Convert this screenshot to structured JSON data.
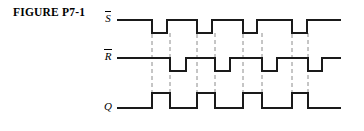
{
  "figure": {
    "caption": "FIGURE P7-1",
    "type": "digital-timing-diagram"
  },
  "signals": [
    {
      "id": "sbar",
      "label": "S",
      "overbar": true,
      "name": "S-bar",
      "active_low": true
    },
    {
      "id": "rbar",
      "label": "R",
      "overbar": true,
      "name": "R-bar",
      "active_low": true
    },
    {
      "id": "q",
      "label": "Q",
      "overbar": false,
      "name": "Q",
      "active_low": false
    }
  ],
  "chart_data": {
    "type": "line",
    "title": "FIGURE P7-1",
    "xlabel": "",
    "ylabel": "",
    "grid": false,
    "legend": "none",
    "x_range": [
      118,
      340
    ],
    "rows": [
      {
        "name": "S-bar",
        "label": "S",
        "overbar": true,
        "y_high": 20,
        "y_low": 33,
        "initial_level": "high",
        "transitions": [
          152,
          167,
          197,
          212,
          243,
          257,
          292,
          307
        ],
        "pulses": [
          {
            "start": 152,
            "end": 167,
            "polarity": "low"
          },
          {
            "start": 197,
            "end": 212,
            "polarity": "low"
          },
          {
            "start": 243,
            "end": 257,
            "polarity": "low"
          },
          {
            "start": 292,
            "end": 307,
            "polarity": "low"
          }
        ]
      },
      {
        "name": "R-bar",
        "label": "R",
        "overbar": true,
        "y_high": 58,
        "y_low": 71,
        "initial_level": "high",
        "transitions": [
          170,
          186,
          215,
          230,
          262,
          277,
          308,
          322
        ],
        "pulses": [
          {
            "start": 170,
            "end": 186,
            "polarity": "low"
          },
          {
            "start": 215,
            "end": 230,
            "polarity": "low"
          },
          {
            "start": 262,
            "end": 277,
            "polarity": "low"
          },
          {
            "start": 308,
            "end": 322,
            "polarity": "low"
          }
        ]
      },
      {
        "name": "Q",
        "label": "Q",
        "overbar": false,
        "y_high": 93,
        "y_low": 108,
        "initial_level": "low",
        "transitions": [
          152,
          170,
          197,
          215,
          243,
          262,
          292,
          308
        ],
        "pulses": [
          {
            "start": 152,
            "end": 170,
            "polarity": "high"
          },
          {
            "start": 197,
            "end": 215,
            "polarity": "high"
          },
          {
            "start": 243,
            "end": 262,
            "polarity": "high"
          },
          {
            "start": 292,
            "end": 308,
            "polarity": "high"
          }
        ]
      }
    ],
    "guide_lines": [
      {
        "x": 152,
        "y_top": 20,
        "y_bottom": 110
      },
      {
        "x": 170,
        "y_top": 33,
        "y_bottom": 110
      },
      {
        "x": 197,
        "y_top": 20,
        "y_bottom": 110
      },
      {
        "x": 215,
        "y_top": 33,
        "y_bottom": 110
      },
      {
        "x": 243,
        "y_top": 20,
        "y_bottom": 110
      },
      {
        "x": 262,
        "y_top": 33,
        "y_bottom": 110
      },
      {
        "x": 292,
        "y_top": 20,
        "y_bottom": 110
      },
      {
        "x": 308,
        "y_top": 33,
        "y_bottom": 110
      }
    ],
    "style": {
      "stroke_color": "#1a1a1a",
      "stroke_width": 1.6,
      "guide_color": "#8c8c8c",
      "guide_dash": "4,3",
      "background": "#ffffff"
    }
  }
}
